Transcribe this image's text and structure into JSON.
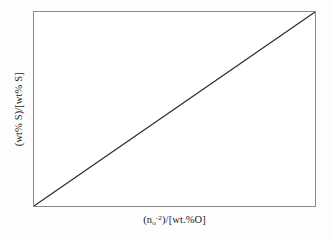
{
  "chart_data": {
    "type": "line",
    "title": "",
    "subtitle": "",
    "xlabel_text": "(n_o^-2)/[wt.%O]",
    "ylabel_text": "(wt% S)/[wt% S]",
    "xlabel_parts": {
      "open_paren": "(",
      "variable": "n",
      "subscript": "o",
      "superscript": "-2",
      "close_paren": ")",
      "divider": "/",
      "denominator": "[wt.%O]"
    },
    "ylabel_parts": {
      "numerator": "(wt% S)",
      "divider": "/",
      "denominator": "[wt% S]"
    },
    "series": [
      {
        "name": "linear relation",
        "x": [
          0,
          1
        ],
        "y": [
          0,
          1
        ],
        "color": "#2b2b2b",
        "style": "solid",
        "width": 1.2
      }
    ],
    "xlim": [
      0,
      1
    ],
    "ylim": [
      0,
      1
    ],
    "grid": false,
    "ticks_shown": false,
    "tick_labels_x": [],
    "tick_labels_y": [],
    "legend": null,
    "legend_position": "none",
    "annotations": [],
    "frame_color": "#8a8a8a",
    "plot_background": "#ffffff",
    "figure_background": "#fdfdfd",
    "note": "Schematic straight line through the origin rising to the upper right corner"
  }
}
